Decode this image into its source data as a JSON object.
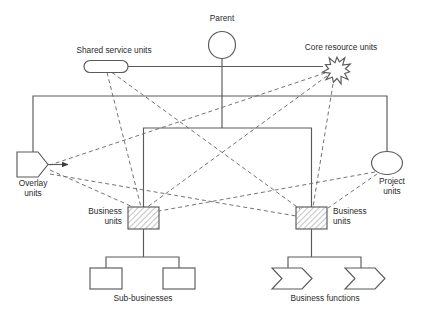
{
  "diagram": {
    "style": {
      "line_color": "#5a5a5a",
      "dashed_color": "#6b6b6b",
      "text_color": "#2b2b2b",
      "background": "#ffffff",
      "hatch_color": "#7a7a7a"
    },
    "nodes": {
      "parent": {
        "label": "Parent",
        "shape": "circle-hatched",
        "label_x": 222,
        "label_y": 21,
        "cx": 222,
        "cy": 45,
        "r": 13.5
      },
      "shared_service_units": {
        "label": "Shared service units",
        "shape": "stadium",
        "label_x": 114,
        "label_y": 53,
        "x": 84,
        "y": 60.5,
        "w": 44,
        "h": 12,
        "rx": 6
      },
      "core_resource_units": {
        "label": "Core resource units",
        "shape": "starburst",
        "label_x": 341,
        "label_y": 50,
        "cx": 337,
        "cy": 70,
        "r_outer": 14.5,
        "r_inner": 8.5,
        "points": 11
      },
      "overlay_units": {
        "label_line1": "Overlay",
        "label_line2": "units",
        "shape": "pentagon-arrow",
        "label_x": 33,
        "label_y": 186,
        "x": 17,
        "y": 152,
        "w": 31,
        "h": 25,
        "arrow_tip_x": 72,
        "arrow_y": 164.5
      },
      "project_units": {
        "label_line1": "Project",
        "label_line2": "units",
        "shape": "ellipse",
        "label_x": 392,
        "label_y": 184,
        "cx": 387,
        "cy": 163,
        "rx": 15.5,
        "ry": 11.5
      },
      "business_units_left": {
        "label_line1": "Business",
        "label_line2": "units",
        "shape": "rect-hatched",
        "label_x": 122,
        "label_y": 214,
        "label_anchor": "end",
        "x": 128,
        "y": 207,
        "w": 31,
        "h": 22
      },
      "business_units_right": {
        "label_line1": "Business",
        "label_line2": "units",
        "shape": "rect-hatched",
        "label_x": 333,
        "label_y": 214,
        "label_anchor": "start",
        "x": 296,
        "y": 207,
        "w": 31,
        "h": 22
      },
      "sub_businesses": {
        "label": "Sub-businesses",
        "shape": "rect",
        "label_x": 143,
        "label_y": 301,
        "boxes": [
          {
            "x": 90,
            "y": 268,
            "w": 32,
            "h": 21
          },
          {
            "x": 163,
            "y": 268,
            "w": 32,
            "h": 21
          }
        ]
      },
      "business_functions": {
        "label": "Business functions",
        "shape": "chevron-arrow",
        "label_x": 325,
        "label_y": 301,
        "boxes": [
          {
            "x": 272,
            "y": 268,
            "w": 40,
            "h": 21
          },
          {
            "x": 345,
            "y": 268,
            "w": 40,
            "h": 21
          }
        ]
      }
    },
    "solid_connections": [
      {
        "name": "parent-stem",
        "d": "M 222 58.5 L 222 128"
      },
      {
        "name": "shared-to-core-horizontal",
        "d": "M 128 66.5 L 323 66.5"
      },
      {
        "name": "outer-bracket",
        "d": "M 33 152 L 33 96 L 387 96 L 387 152"
      },
      {
        "name": "inner-bracket",
        "d": "M 143.5 207 L 143.5 128 L 311.5 128 L 311.5 207"
      },
      {
        "name": "bu-left-stem-down",
        "d": "M 143.5 229 L 143.5 257"
      },
      {
        "name": "sub-bracket-left",
        "d": "M 106 268 L 106 257 L 179 257 L 179 268"
      },
      {
        "name": "bu-right-stem-down",
        "d": "M 311.5 229 L 311.5 257"
      },
      {
        "name": "func-bracket-right",
        "d": "M 288 268 L 288 257 L 361 257 L 361 268"
      }
    ],
    "dashed_connections": [
      {
        "name": "shared-to-bu-left",
        "d": "M 107 72.5 L 141 207"
      },
      {
        "name": "shared-to-bu-right",
        "d": "M 112 72.5 L 300 209"
      },
      {
        "name": "core-to-bu-left",
        "d": "M 327 76 L 146 208"
      },
      {
        "name": "core-to-bu-right",
        "d": "M 333 84 L 313 207"
      },
      {
        "name": "core-to-overlay",
        "d": "M 325 73 L 50 165"
      },
      {
        "name": "overlay-to-bu-left",
        "d": "M 50 170 L 133 207"
      },
      {
        "name": "overlay-to-bu-right",
        "d": "M 50 174 L 296 216"
      },
      {
        "name": "project-to-bu-left",
        "d": "M 375 172 L 159 211"
      },
      {
        "name": "project-to-bu-right",
        "d": "M 377 174 L 328 208"
      }
    ]
  }
}
